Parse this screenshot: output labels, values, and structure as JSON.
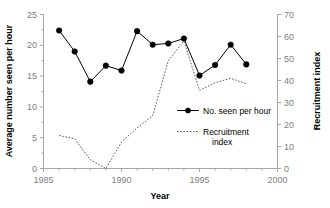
{
  "chart_data": {
    "type": "line",
    "title": "",
    "xlabel": "Year",
    "ylabel": "Average number seen per hour",
    "y2label": "Recruitment index",
    "xlim": [
      1985,
      2000
    ],
    "ylim": [
      0,
      25
    ],
    "y2lim": [
      0,
      70
    ],
    "xticks": [
      1985,
      1990,
      1995,
      2000
    ],
    "xtick_labels": [
      "1985",
      "1990",
      "1995",
      "2000"
    ],
    "xminor_step": 1,
    "yticks": [
      0,
      5,
      10,
      15,
      20,
      25
    ],
    "ytick_labels": [
      "0",
      "5",
      "10",
      "15",
      "20",
      "25"
    ],
    "y2ticks": [
      0,
      10,
      20,
      30,
      40,
      50,
      60,
      70
    ],
    "y2tick_labels": [
      "0",
      "10",
      "20",
      "30",
      "40",
      "50",
      "60",
      "70"
    ],
    "grid": false,
    "legend_position": "center-right-inside",
    "series": [
      {
        "name": "No. seen per hour",
        "axis": "left",
        "style": "solid",
        "marker": "filled-circle",
        "color": "#000000",
        "x": [
          1986,
          1987,
          1988,
          1989,
          1990,
          1991,
          1992,
          1993,
          1994,
          1995,
          1996,
          1997,
          1998
        ],
        "values": [
          22.4,
          19.0,
          14.1,
          16.7,
          15.9,
          22.3,
          20.1,
          20.3,
          21.1,
          15.1,
          16.8,
          20.1,
          16.9
        ]
      },
      {
        "name": "Recruitment index",
        "axis": "right",
        "style": "dotted",
        "marker": "none",
        "color": "#595959",
        "x": [
          1986,
          1987,
          1988,
          1989,
          1990,
          1991,
          1992,
          1993,
          1994,
          1995,
          1996,
          1997,
          1998
        ],
        "values": [
          15.0,
          13.5,
          4.0,
          0.0,
          12.0,
          18.5,
          24.0,
          49.0,
          58.0,
          35.5,
          39.0,
          41.0,
          38.5
        ]
      }
    ],
    "legend_entries": [
      {
        "label": "No. seen per hour",
        "style": "solid-marker"
      },
      {
        "label": "Recruitment",
        "label2": "index",
        "style": "dotted"
      }
    ]
  },
  "axes": {
    "x_title": "Year",
    "y_left_title": "Average number seen per hour",
    "y_right_title": "Recruitment index"
  },
  "legend": {
    "entry1": "No. seen per hour",
    "entry2_line1": "Recruitment",
    "entry2_line2": "index"
  },
  "colors": {
    "series1": "#000000",
    "series2": "#595959",
    "axis": "#a6a6a6",
    "tick_text": "#808080",
    "background": "#ffffff"
  }
}
